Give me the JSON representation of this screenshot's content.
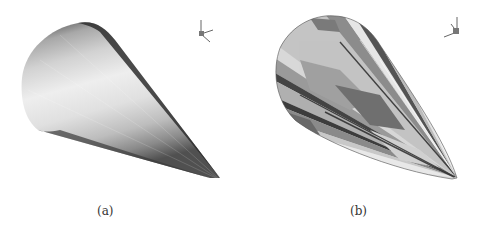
{
  "figure": {
    "panels": [
      {
        "id": "a",
        "caption": "(a)",
        "description": "smoothly shaded cone",
        "axis_triad": {
          "labels": [
            "y",
            "x",
            "z"
          ]
        }
      },
      {
        "id": "b",
        "caption": "(b)",
        "description": "cone with banded gray contour stripes",
        "axis_triad": {
          "labels": [
            "y",
            "x",
            "z"
          ]
        }
      }
    ]
  }
}
